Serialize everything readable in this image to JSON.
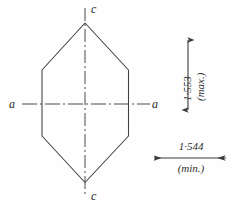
{
  "figure": {
    "type": "crystal-optical-indicatrix-sketch",
    "background_color": "#fefefe",
    "ink_color": "#3a3a3a"
  },
  "crystal": {
    "shape": "elongated-hexagon",
    "outline_points": "85,23 128,70 128,136 85,182 42,136 42,70"
  },
  "axes": [
    {
      "name": "c-axis",
      "orientation": "vertical",
      "label_top": "c",
      "label_bottom": "c",
      "line_style": "dash-dot"
    },
    {
      "name": "a-axis",
      "orientation": "horizontal",
      "label_left": "a",
      "label_right": "a",
      "line_style": "dash-dot"
    }
  ],
  "labels": {
    "c_top": "c",
    "c_bottom": "c",
    "a_left": "a",
    "a_right": "a"
  },
  "dimensions": [
    {
      "id": "vertical-dimension",
      "value": "1·553",
      "qualifier": "(max.)",
      "orientation": "vertical",
      "arrow": "double-headed"
    },
    {
      "id": "horizontal-dimension",
      "value": "1·544",
      "qualifier": "(min.)",
      "orientation": "horizontal",
      "arrow": "double-headed"
    }
  ]
}
